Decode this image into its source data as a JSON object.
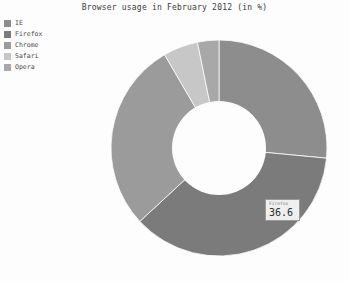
{
  "chart_data": {
    "type": "pie",
    "variant": "donut",
    "title": "Browser usage in February 2012 (in %)",
    "xlabel": "",
    "ylabel": "",
    "unit": "%",
    "legend_position": "top-left",
    "grid": false,
    "categories": [
      "IE",
      "Firefox",
      "Chrome",
      "Safari",
      "Opera"
    ],
    "values": [
      26.5,
      36.6,
      28.5,
      5.2,
      3.2
    ],
    "colors": [
      "#8d8d8d",
      "#7b7b7b",
      "#9b9b9b",
      "#c7c7c7",
      "#a8a8a8"
    ],
    "series": [
      {
        "name": "Browser usage",
        "values": [
          26.5,
          36.6,
          28.5,
          5.2,
          3.2
        ]
      }
    ],
    "annotations": [
      {
        "label": "Firefox",
        "value": "36.6"
      }
    ]
  },
  "legend": {
    "items": [
      {
        "label": "IE",
        "color": "#8d8d8d"
      },
      {
        "label": "Firefox",
        "color": "#7b7b7b"
      },
      {
        "label": "Chrome",
        "color": "#9b9b9b"
      },
      {
        "label": "Safari",
        "color": "#c7c7c7"
      },
      {
        "label": "Opera",
        "color": "#a8a8a8"
      }
    ]
  },
  "tooltip": {
    "name": "Firefox",
    "value": "36.6"
  },
  "geometry": {
    "center_x": 110,
    "center_y": 110,
    "outer_radius": 108,
    "inner_radius": 47,
    "start_angle": -90
  },
  "colors": {
    "background": "#fdfdfd",
    "title_text": "#3b3b3b",
    "legend_text": "#4a4a4a",
    "tooltip_bg": "#efefef",
    "tooltip_border": "#9a9a9a",
    "hole": "#fdfdfd"
  }
}
